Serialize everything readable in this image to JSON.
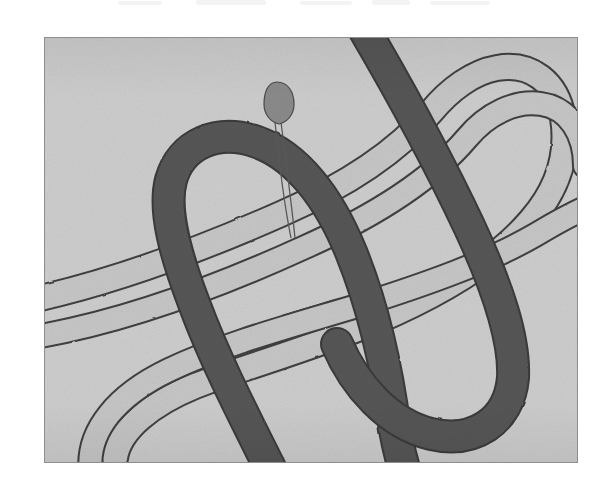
{
  "page": {
    "background_color": "#ffffff",
    "scan_artifact": "top-edge ink bleed"
  },
  "figure": {
    "name": "knot-diagram-plate",
    "frame": {
      "x": 44,
      "y": 37,
      "width": 534,
      "height": 426,
      "background_color": "#cdcdcd",
      "border_color": "#8d8d8d",
      "border_width": 1
    },
    "title": "",
    "colors": {
      "plate_background": "#cdcdcd",
      "dark_band_fill": "#545454",
      "dark_band_edge": "#3a3a3a",
      "light_band_fill": "#c2c2c2",
      "light_band_outline": "#3f3f3f",
      "pointer_fill": "#8a8a8a",
      "pointer_outline": "#4a4a4a",
      "pointer_tail": "#5a5a5a"
    },
    "elements": [
      {
        "name": "dark-band",
        "label": "dark ribbon",
        "style": "solid filled band"
      },
      {
        "name": "light-band",
        "label": "light ribbon",
        "style": "outlined open band"
      },
      {
        "name": "pointer-marker",
        "label": "teardrop pointer with hairline tail"
      }
    ],
    "crossings": [
      {
        "name": "crossing-upper-right",
        "over": "dark-band",
        "under": "light-band"
      },
      {
        "name": "crossing-upper-left",
        "over": "dark-band",
        "under": "light-band"
      },
      {
        "name": "crossing-center",
        "over": "light-band",
        "under": "dark-band"
      },
      {
        "name": "crossing-lower-left",
        "over": "dark-band",
        "under": "light-band"
      },
      {
        "name": "crossing-lower-right",
        "over": "light-band",
        "under": "dark-band"
      },
      {
        "name": "crossing-left-edge",
        "over": "dark-band",
        "under": "light-band"
      }
    ],
    "pointer": {
      "name": "pointer-marker",
      "head": {
        "cx": 274,
        "cy": 121,
        "rx": 11,
        "ry": 20
      },
      "tail_end": {
        "x": 289,
        "y": 237
      }
    }
  }
}
